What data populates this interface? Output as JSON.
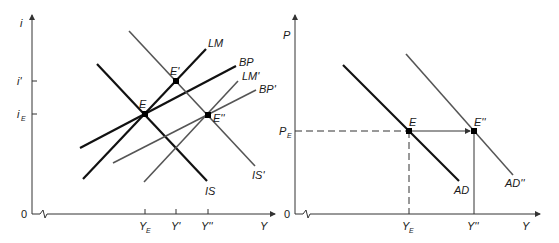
{
  "left_panel": {
    "y_axis_label": "i",
    "x_axis_label": "Y",
    "origin_label": "0",
    "y_ticks": [
      {
        "label": "i'",
        "sub": "",
        "y": 81
      },
      {
        "label": "i",
        "sub": "E",
        "y": 114
      }
    ],
    "x_ticks": [
      {
        "label": "Y",
        "sub": "E",
        "x": 145
      },
      {
        "label": "Y'",
        "sub": "",
        "x": 176
      },
      {
        "label": "Y''",
        "sub": "",
        "x": 208
      }
    ],
    "curves": [
      {
        "name": "IS",
        "label": "IS",
        "color": "#111111",
        "width": 2.2,
        "x1": 97,
        "y1": 64,
        "x2": 207,
        "y2": 181,
        "lx": 205,
        "ly": 195
      },
      {
        "name": "LM",
        "label": "LM",
        "color": "#111111",
        "width": 2.2,
        "x1": 83,
        "y1": 179,
        "x2": 206,
        "y2": 49,
        "lx": 208,
        "ly": 47
      },
      {
        "name": "BP",
        "label": "BP",
        "color": "#111111",
        "width": 2.2,
        "x1": 80,
        "y1": 148,
        "x2": 236,
        "y2": 66,
        "lx": 239,
        "ly": 66
      },
      {
        "name": "IS-prime",
        "label": "IS'",
        "color": "#555555",
        "width": 1.6,
        "x1": 129,
        "y1": 31,
        "x2": 255,
        "y2": 166,
        "lx": 252,
        "ly": 179
      },
      {
        "name": "LM-prime",
        "label": "LM'",
        "color": "#555555",
        "width": 1.6,
        "x1": 144,
        "y1": 182,
        "x2": 238,
        "y2": 81,
        "lx": 242,
        "ly": 80
      },
      {
        "name": "BP-prime",
        "label": "BP'",
        "color": "#555555",
        "width": 1.6,
        "x1": 113,
        "y1": 163,
        "x2": 256,
        "y2": 90,
        "lx": 259,
        "ly": 93
      }
    ],
    "points": [
      {
        "name": "E",
        "label": "E",
        "x": 145,
        "y": 114,
        "lx": 139,
        "ly": 108
      },
      {
        "name": "E-prime",
        "label": "E'",
        "x": 176,
        "y": 81,
        "lx": 170,
        "ly": 75
      },
      {
        "name": "E-double-prime",
        "label": "E''",
        "x": 208,
        "y": 115,
        "lx": 213,
        "ly": 122
      }
    ]
  },
  "right_panel": {
    "y_axis_label": "P",
    "x_axis_label": "Y",
    "origin_label": "0",
    "y_ticks": [
      {
        "label": "P",
        "sub": "E",
        "y": 131
      }
    ],
    "x_ticks": [
      {
        "label": "Y",
        "sub": "E",
        "x": 409
      },
      {
        "label": "Y''",
        "sub": "",
        "x": 474
      }
    ],
    "curves": [
      {
        "name": "AD",
        "label": "AD",
        "color": "#111111",
        "width": 2.2,
        "x1": 343,
        "y1": 65,
        "x2": 459,
        "y2": 181,
        "lx": 454,
        "ly": 194
      },
      {
        "name": "AD-double-prime",
        "label": "AD''",
        "color": "#555555",
        "width": 1.6,
        "x1": 406,
        "y1": 54,
        "x2": 513,
        "y2": 175,
        "lx": 505,
        "ly": 187
      }
    ],
    "points": [
      {
        "name": "E",
        "label": "E",
        "x": 409,
        "y": 131,
        "lx": 409,
        "ly": 126
      },
      {
        "name": "E-double-prime",
        "label": "E''",
        "x": 474,
        "y": 131,
        "lx": 474,
        "ly": 126
      }
    ]
  }
}
